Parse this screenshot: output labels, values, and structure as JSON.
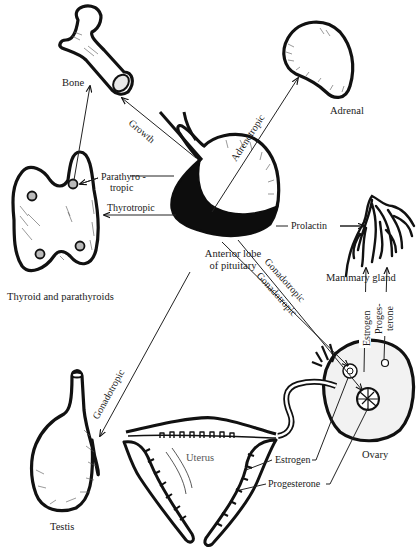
{
  "figure": {
    "type": "diagram",
    "colors": {
      "ink": "#111111",
      "background": "#ffffff",
      "muted_label": "#555555"
    },
    "center": {
      "id": "pituitary",
      "label_line1": "Anterior lobe",
      "label_line2": "of pituitary"
    },
    "organs": {
      "bone": "Bone",
      "adrenal": "Adrenal",
      "thyroid": "Thyroid and parathyroids",
      "mammary": "Mammary gland",
      "testis": "Testis",
      "ovary": "Ovary",
      "uterus": "Uterus"
    },
    "hormones": {
      "growth": "Growth",
      "adrenotropic": "Adrenotropic",
      "parathyrotropic_line1": "Parathyro -",
      "parathyrotropic_line2": "tropic",
      "thyrotropic": "Thyrotropic",
      "prolactin": "Prolactin",
      "gonadotropic_testis": "Gonadotropic",
      "gonadotropic_ovary_1": "Gonadotropic",
      "gonadotropic_ovary_2": "Gonadotropic",
      "estrogen_mammary": "Estrogen",
      "progesterone_mammary_line1": "Proges-",
      "progesterone_mammary_line2": "terone",
      "estrogen_uterus": "Estrogen",
      "progesterone_uterus": "Progesterone"
    },
    "connections": [
      {
        "from": "pituitary",
        "to": "bone",
        "label": "Growth"
      },
      {
        "from": "pituitary",
        "to": "adrenal",
        "label": "Adrenotropic"
      },
      {
        "from": "pituitary",
        "to": "parathyroids",
        "label": "Parathyrotropic"
      },
      {
        "from": "pituitary",
        "to": "thyroid",
        "label": "Thyrotropic"
      },
      {
        "from": "pituitary",
        "to": "mammary gland",
        "label": "Prolactin"
      },
      {
        "from": "pituitary",
        "to": "testis",
        "label": "Gonadotropic"
      },
      {
        "from": "pituitary",
        "to": "ovary",
        "label": "Gonadotropic"
      },
      {
        "from": "pituitary",
        "to": "ovary",
        "label": "Gonadotropic"
      },
      {
        "from": "ovary",
        "to": "mammary gland",
        "label": "Estrogen"
      },
      {
        "from": "ovary",
        "to": "mammary gland",
        "label": "Progesterone"
      },
      {
        "from": "ovary",
        "to": "uterus",
        "label": "Estrogen"
      },
      {
        "from": "ovary",
        "to": "uterus",
        "label": "Progesterone"
      },
      {
        "from": "parathyroids",
        "to": "bone",
        "label": ""
      }
    ]
  }
}
